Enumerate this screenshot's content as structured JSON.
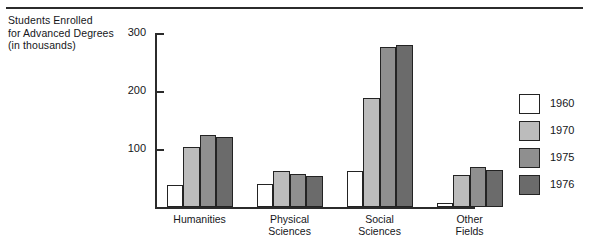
{
  "chart_data": {
    "type": "bar",
    "title": "",
    "ylabel": "Students Enrolled for Advanced Degrees (in thousands)",
    "ylabel_lines": [
      "Students Enrolled",
      "for Advanced Degrees",
      "(in thousands)"
    ],
    "xlabel": "",
    "categories": [
      "Humanities",
      "Physical Sciences",
      "Social Sciences",
      "Other Fields"
    ],
    "category_lines": [
      [
        "Humanities"
      ],
      [
        "Physical",
        "Sciences"
      ],
      [
        "Social",
        "Sciences"
      ],
      [
        "Other",
        "Fields"
      ]
    ],
    "series": [
      {
        "name": "1960",
        "color": "#ffffff",
        "values": [
          38,
          40,
          63,
          8
        ]
      },
      {
        "name": "1970",
        "color": "#bcbcbc",
        "values": [
          105,
          63,
          188,
          56
        ]
      },
      {
        "name": "1975",
        "color": "#8f8f8f",
        "values": [
          124,
          57,
          277,
          70
        ]
      },
      {
        "name": "1976",
        "color": "#6b6b6b",
        "values": [
          122,
          54,
          280,
          65
        ]
      }
    ],
    "ylim": [
      0,
      300
    ],
    "yticks": [
      100,
      200,
      300
    ],
    "ytick_labels": [
      "100",
      "200",
      "300"
    ],
    "grid": false,
    "legend_position": "right",
    "legend_entries": [
      "1960",
      "1970",
      "1975",
      "1976"
    ],
    "axis_color": "#2b2b2b",
    "bar_edge_color": "#232323"
  }
}
